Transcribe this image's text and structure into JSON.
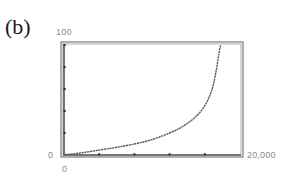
{
  "panel": {
    "label": "(b)"
  },
  "axes": {
    "y_max_label": "100",
    "y_min_label": "0",
    "x_min_label": "0",
    "x_max_label": "20,000"
  },
  "colors": {
    "frame": "#6e6e6e",
    "curve": "#5a5a5a",
    "ticks": "#333333",
    "labels": "#8a8a8a"
  },
  "chart_data": {
    "type": "line",
    "title": "(b)",
    "xlabel": "",
    "ylabel": "",
    "xlim": [
      0,
      20000
    ],
    "ylim": [
      0,
      100
    ],
    "x_tick_labels": [
      "0",
      "20,000"
    ],
    "y_tick_labels": [
      "0",
      "100"
    ],
    "x_ticks": [
      4000,
      8000,
      12000,
      16000
    ],
    "y_ticks": [
      20,
      40,
      60,
      80
    ],
    "grid": false,
    "legend": null,
    "series": [
      {
        "name": "curve",
        "x": [
          500,
          2000,
          4000,
          6000,
          8000,
          10000,
          12000,
          13500,
          15000,
          16000,
          16800,
          17300,
          17600,
          17800
        ],
        "y": [
          0.5,
          2,
          4.5,
          7,
          10,
          14,
          20,
          26,
          35,
          45,
          59,
          77,
          92,
          100
        ]
      }
    ]
  }
}
